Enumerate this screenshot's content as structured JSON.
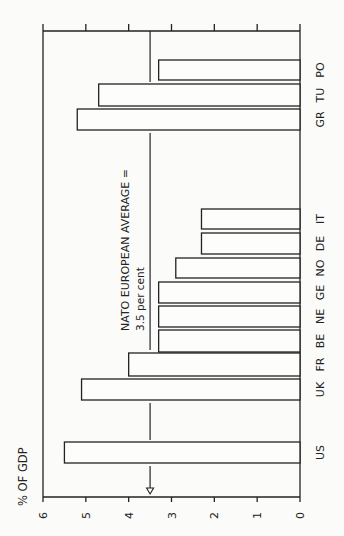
{
  "chart_data": {
    "type": "bar",
    "orientation": "vertical bars, image rotated 90 degrees counter-clockwise",
    "title": "",
    "ylabel": "% OF GDP",
    "xlabel": "",
    "ylim": [
      0,
      6
    ],
    "yticks": [
      "0",
      "1",
      "2",
      "3",
      "4",
      "5",
      "6"
    ],
    "grid": false,
    "legend": null,
    "categories": [
      "US",
      "UK",
      "FR",
      "BE",
      "NE",
      "GE",
      "NO",
      "DE",
      "IT",
      "GR",
      "TU",
      "PO"
    ],
    "values": [
      5.5,
      5.1,
      4.0,
      3.3,
      3.3,
      3.3,
      2.9,
      2.3,
      2.3,
      5.2,
      4.7,
      3.3
    ],
    "reference_line": {
      "value": 3.5,
      "label_line1": "NATO EUROPEAN AVERAGE =",
      "label_line2": "3.5 per cent"
    }
  },
  "layout": {
    "bar_y_ranges": [
      [
        442,
        463
      ],
      [
        379,
        400
      ],
      [
        353,
        376
      ],
      [
        330,
        352
      ],
      [
        306,
        327
      ],
      [
        282,
        303
      ],
      [
        258,
        278
      ],
      [
        233,
        254
      ],
      [
        209,
        229
      ],
      [
        109,
        130
      ],
      [
        84,
        106
      ],
      [
        60,
        80
      ]
    ]
  }
}
